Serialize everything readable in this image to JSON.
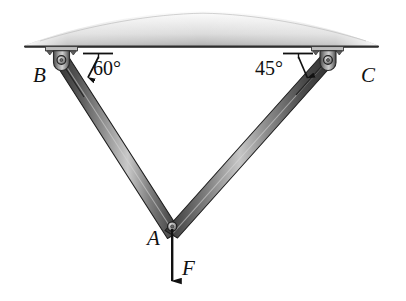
{
  "figure": {
    "type": "engineering-statics-diagram",
    "background_color": "#ffffff",
    "width": 406,
    "height": 301
  },
  "ceiling": {
    "name": "ceiling-slab",
    "fill_light": "#f2f2f2",
    "fill_mid": "#cfcfcf",
    "fill_dark": "#8f8f8f",
    "edge_color": "#3a3a3a",
    "left_x": 25,
    "right_x": 378,
    "baseline_y": 46
  },
  "members": {
    "color_dark": "#3b3b3b",
    "color_mid": "#6f6f6f",
    "color_light": "#d8d8d8",
    "outline": "#1d1d1d",
    "list": [
      {
        "name": "member-AB",
        "from": "B",
        "to": "A",
        "angle_label": "60°"
      },
      {
        "name": "member-AC",
        "from": "C",
        "to": "A",
        "angle_label": "45°"
      }
    ]
  },
  "joints": [
    {
      "name": "joint-B",
      "label": "B",
      "x": 61,
      "y": 60,
      "kind": "pin-support"
    },
    {
      "name": "joint-C",
      "label": "C",
      "x": 328,
      "y": 60,
      "kind": "pin-support"
    },
    {
      "name": "joint-A",
      "label": "A",
      "x": 172,
      "y": 225,
      "kind": "pin-joint"
    }
  ],
  "labels": {
    "point_B": "B",
    "point_C": "C",
    "point_A": "A",
    "force": "F"
  },
  "angles": {
    "left": "60°",
    "right": "45°"
  },
  "force": {
    "name": "applied-force-F",
    "label": "F",
    "direction": "down",
    "tail_x": 172,
    "tail_y": 228,
    "head_x": 172,
    "head_y": 280,
    "color": "#111111"
  },
  "icons": {
    "arrow_down_icon": "arrow-down-icon",
    "angle_arrow_icon": "angle-arrow-icon",
    "pin_support_icon": "pin-support-icon"
  }
}
